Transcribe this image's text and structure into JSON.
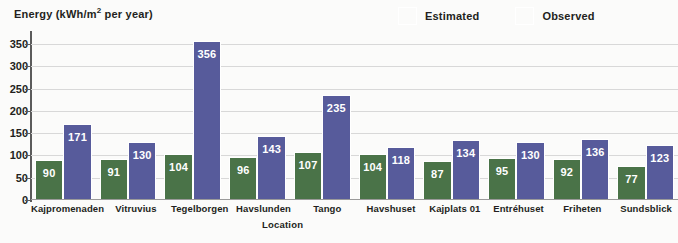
{
  "chart_data": {
    "type": "bar",
    "title": "",
    "ylabel": "Energy (kWh/m² per year)",
    "ylabel_prefix": "Energy (kWh/m",
    "ylabel_sup": "2",
    "ylabel_suffix": " per year)",
    "xlabel": "Location",
    "ylim": [
      0,
      375
    ],
    "yticks": [
      0,
      50,
      100,
      150,
      200,
      250,
      300,
      350
    ],
    "ytick_labels": [
      "0",
      "50",
      "100",
      "150",
      "200",
      "250",
      "300",
      "350"
    ],
    "grid": true,
    "legend_position": "top-right",
    "categories": [
      "Kajpromenaden",
      "Vitruvius",
      "Tegelborgen",
      "Havslunden",
      "Tango",
      "Havshuset",
      "Kajplats 01",
      "Entréhuset",
      "Friheten",
      "Sundsblick"
    ],
    "series": [
      {
        "name": "Estimated",
        "color": "#4a7348",
        "values": [
          90,
          91,
          104,
          96,
          107,
          104,
          87,
          95,
          92,
          77
        ]
      },
      {
        "name": "Observed",
        "color": "#575b9b",
        "values": [
          171,
          130,
          356,
          143,
          235,
          118,
          134,
          130,
          136,
          123
        ]
      }
    ]
  }
}
